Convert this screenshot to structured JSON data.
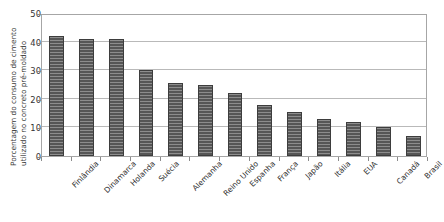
{
  "chart_data": {
    "type": "bar",
    "title": "",
    "subtitle": "",
    "xlabel": "",
    "ylabel": "Porcentagem do consumo de cimento utilizado no concreto pré-moldado",
    "ylabel_lines": [
      "Porcentagem do consumo de cimento",
      "utilizado no concreto pré-moldado"
    ],
    "categories": [
      "Finlândia",
      "Dinamarca",
      "Holanda",
      "Suécia",
      "Alemanha",
      "Reino Unido",
      "Espanha",
      "França",
      "Japão",
      "Itália",
      "EUA",
      "Canadá",
      "Brasil"
    ],
    "values": [
      42,
      41,
      41,
      30,
      25.5,
      25,
      22,
      18,
      15.5,
      13,
      12,
      10,
      7
    ],
    "ylim": [
      0,
      50
    ],
    "ytick_values": [
      0,
      10,
      20,
      30,
      40,
      50
    ],
    "ytick_labels": [
      "0",
      "10",
      "20",
      "30",
      "40",
      "50"
    ],
    "grid": true,
    "grid_axis": "y",
    "legend": false,
    "legend_position": "none",
    "bar_color": "#5f5f5f",
    "bar_edge_color": "#3d3d3d",
    "bar_pattern": "horizontal-stripes",
    "grid_color": "#b9b9b9",
    "axis_color": "#a6a6a6",
    "background_color": "#ffffff",
    "text_color": "#231f20"
  }
}
